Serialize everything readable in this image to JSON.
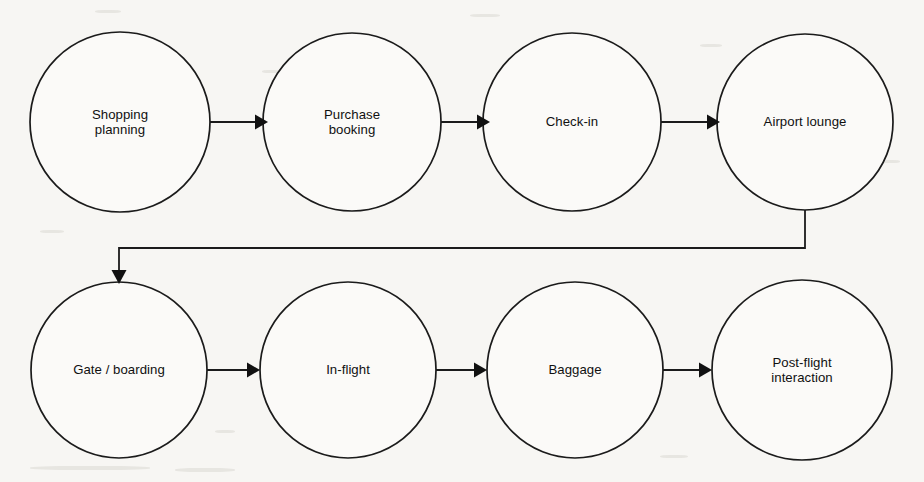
{
  "diagram": {
    "type": "flowchart",
    "orientation": "horizontal-serpentine",
    "background_color": "#f7f6f3",
    "line_color": "#1b1b1b",
    "node_fill_color": "#fbfaf8",
    "text_color": "#101010",
    "nodes": [
      {
        "id": "shopping-planning",
        "label_line1": "Shopping",
        "label_line2": "planning",
        "cx": 120,
        "cy": 122,
        "r": 90,
        "row": 1,
        "order": 1
      },
      {
        "id": "purchase-booking",
        "label_line1": "Purchase",
        "label_line2": "booking",
        "cx": 352,
        "cy": 122,
        "r": 89,
        "row": 1,
        "order": 2
      },
      {
        "id": "check-in",
        "label_line1": "Check-in",
        "label_line2": "",
        "cx": 572,
        "cy": 122,
        "r": 89,
        "row": 1,
        "order": 3
      },
      {
        "id": "airport-lounge",
        "label_line1": "Airport lounge",
        "label_line2": "",
        "cx": 805,
        "cy": 122,
        "r": 88,
        "row": 1,
        "order": 4
      },
      {
        "id": "gate-boarding",
        "label_line1": "Gate / boarding",
        "label_line2": "",
        "cx": 119,
        "cy": 370,
        "r": 88,
        "row": 2,
        "order": 5
      },
      {
        "id": "in-flight",
        "label_line1": "In-flight",
        "label_line2": "",
        "cx": 348,
        "cy": 370,
        "r": 88,
        "row": 2,
        "order": 6
      },
      {
        "id": "baggage",
        "label_line1": "Baggage",
        "label_line2": "",
        "cx": 575,
        "cy": 370,
        "r": 88,
        "row": 2,
        "order": 7
      },
      {
        "id": "post-flight-interaction",
        "label_line1": "Post-flight",
        "label_line2": "interaction",
        "cx": 802,
        "cy": 370,
        "r": 90,
        "row": 2,
        "order": 8
      }
    ],
    "connectors": [
      {
        "id": "c1",
        "from": "shopping-planning",
        "to": "purchase-booking",
        "style": "straight-arrow"
      },
      {
        "id": "c2",
        "from": "purchase-booking",
        "to": "check-in",
        "style": "straight-arrow"
      },
      {
        "id": "c3",
        "from": "check-in",
        "to": "airport-lounge",
        "style": "straight-arrow"
      },
      {
        "id": "c4",
        "from": "airport-lounge",
        "to": "gate-boarding",
        "style": "elbow-wrap-arrow"
      },
      {
        "id": "c5",
        "from": "gate-boarding",
        "to": "in-flight",
        "style": "straight-arrow"
      },
      {
        "id": "c6",
        "from": "in-flight",
        "to": "baggage",
        "style": "straight-arrow"
      },
      {
        "id": "c7",
        "from": "baggage",
        "to": "post-flight-interaction",
        "style": "straight-arrow"
      }
    ]
  }
}
